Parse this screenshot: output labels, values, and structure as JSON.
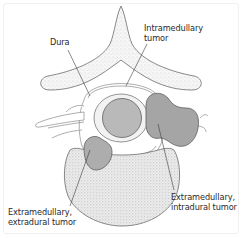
{
  "diagram": {
    "type": "anatomical cross-section of spine",
    "structures": [
      "spinous process / vertebral arch",
      "dura",
      "spinal cord",
      "vertebral body",
      "nerve roots"
    ],
    "colors": {
      "outline": "#6b6b6b",
      "bone_fill": "#f4f4f4",
      "bone_stipple": "#b8b8b8",
      "cord_fill": "#bdbdbd",
      "tumor_intramedullary": "#b7b7b7",
      "tumor_intradural": "#a3a3a3",
      "tumor_extradural": "#ababab",
      "leader_line": "#3a3a3a"
    }
  },
  "labels": {
    "dura": "Dura",
    "intramedullary_line1": "Intramedullary",
    "intramedullary_line2": "tumor",
    "ext_intradural_line1": "Extramedullary,",
    "ext_intradural_line2": "intradural tumor",
    "ext_extradural_line1": "Extramedullary,",
    "ext_extradural_line2": "extradural tumor"
  }
}
